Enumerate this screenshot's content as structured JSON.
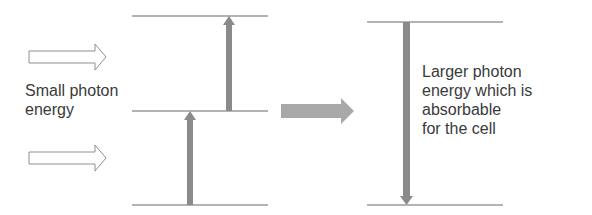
{
  "diagram": {
    "left_label": [
      "Small photon",
      "energy"
    ],
    "right_label": [
      "Larger photon",
      "energy which is",
      "absorbable",
      "for the cell"
    ],
    "colors": {
      "line": "#9a9a9a",
      "arrow_fill": "#8a8a8a",
      "big_arrow": "#a8a8a8",
      "outline_arrow": "#8f8f8f",
      "text": "#3a3a3a"
    },
    "left_levels": 3,
    "right_levels": 2
  }
}
